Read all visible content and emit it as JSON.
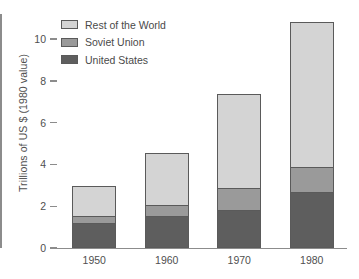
{
  "chart_data": {
    "type": "bar",
    "stacked": true,
    "title": "",
    "xlabel": "",
    "ylabel": "Trillions of US $ (1980 value)",
    "categories": [
      "1950",
      "1960",
      "1970",
      "1980"
    ],
    "series": [
      {
        "name": "United States",
        "values": [
          1.2,
          1.5,
          1.8,
          2.65
        ],
        "color": "#5e5e5e"
      },
      {
        "name": "Soviet Union",
        "values": [
          0.35,
          0.55,
          1.05,
          1.2
        ],
        "color": "#9a9a9a"
      },
      {
        "name": "Rest of the World",
        "values": [
          1.4,
          2.5,
          4.5,
          6.95
        ],
        "color": "#d4d4d4"
      }
    ],
    "totals": [
      2.95,
      4.55,
      7.35,
      10.8
    ],
    "ylim": [
      0,
      11.2
    ],
    "yticks": [
      0,
      2,
      4,
      6,
      8,
      10
    ],
    "ytick_labels": [
      "0",
      "2",
      "4",
      "6",
      "8",
      "10"
    ],
    "grid": false,
    "legend_position": "top-left",
    "legend_order": [
      "Rest of the World",
      "Soviet Union",
      "United States"
    ]
  },
  "legend": {
    "items": [
      {
        "label": "Rest of the World",
        "color": "#d4d4d4"
      },
      {
        "label": "Soviet Union",
        "color": "#9a9a9a"
      },
      {
        "label": "United States",
        "color": "#5e5e5e"
      }
    ]
  },
  "axes": {
    "y_title": "Trillions of US $ (1980 value)",
    "y_labels": [
      "10",
      "8",
      "6",
      "4",
      "2",
      "0"
    ],
    "x_labels": [
      "1950",
      "1960",
      "1970",
      "1980"
    ]
  }
}
